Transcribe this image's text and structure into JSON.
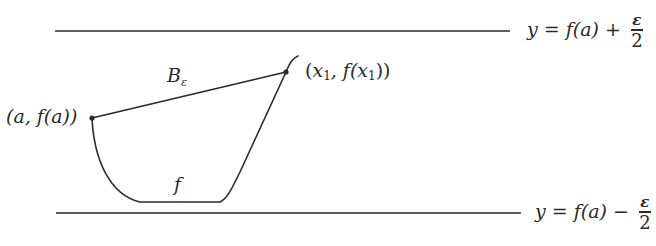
{
  "diagram": {
    "title": "",
    "upper_bound": {
      "label_lhs": "y",
      "label_eq": " = ",
      "label_func": "f(a)",
      "label_op": " + ",
      "frac_num": "ε",
      "frac_den": "2"
    },
    "lower_bound": {
      "label_lhs": "y",
      "label_eq": " = ",
      "label_func": "f(a)",
      "label_op": " − ",
      "frac_num": "ε",
      "frac_den": "2"
    },
    "point_a": {
      "label": "(a, f(a))"
    },
    "point_x1": {
      "label_open": "(",
      "x": "x",
      "x_sub": "1",
      "mid": ", f(",
      "x2": "x",
      "x2_sub": "1",
      "close": "))"
    },
    "ball": {
      "label": "B",
      "sub": "ε"
    },
    "curve": {
      "label": "f"
    },
    "colors": {
      "stroke": "#2a2a2a",
      "background": "#ffffff"
    }
  }
}
